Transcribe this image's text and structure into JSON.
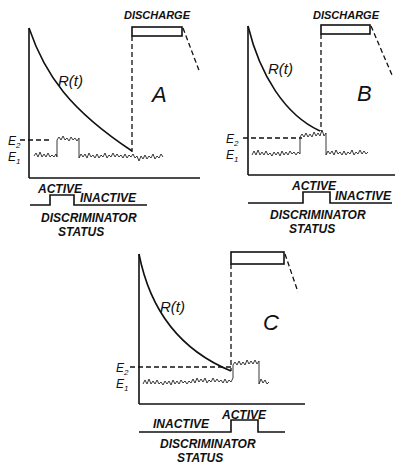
{
  "panels": [
    {
      "id": "A",
      "letter": "A",
      "discharge_label": "DISCHARGE",
      "curve_label": "R(t)",
      "e2_label": "E2",
      "e1_label": "E1",
      "active_label": "ACTIVE",
      "inactive_label": "INACTIVE",
      "status_line1": "DISCRIMINATOR",
      "status_line2": "STATUS"
    },
    {
      "id": "B",
      "letter": "B",
      "discharge_label": "DISCHARGE",
      "curve_label": "R(t)",
      "e2_label": "E2",
      "e1_label": "E1",
      "active_label": "ACTIVE",
      "inactive_label": "INACTIVE",
      "status_line1": "DISCRIMINATOR",
      "status_line2": "STATUS"
    },
    {
      "id": "C",
      "letter": "C",
      "curve_label": "R(t)",
      "e2_label": "E2",
      "e1_label": "E1",
      "active_label": "ACTIVE",
      "inactive_label": "INACTIVE",
      "status_line1": "DISCRIMINATOR",
      "status_line2": "STATUS"
    }
  ]
}
